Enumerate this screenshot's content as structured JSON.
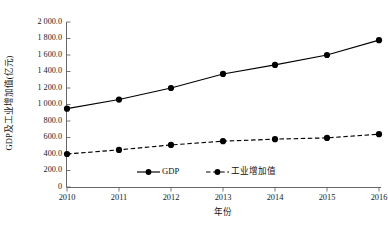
{
  "chart_data": {
    "type": "line",
    "title": "",
    "xlabel": "年份",
    "ylabel": "GDP及工业增加值(亿元)",
    "categories": [
      "2010",
      "2011",
      "2012",
      "2013",
      "2014",
      "2015",
      "2016"
    ],
    "x": [
      2010,
      2011,
      2012,
      2013,
      2014,
      2015,
      2016
    ],
    "series": [
      {
        "name": "GDP",
        "style": "solid",
        "marker": "filled-circle",
        "values": [
          950,
          1060,
          1200,
          1370,
          1480,
          1600,
          1780
        ]
      },
      {
        "name": "工业增加值",
        "style": "dashed",
        "marker": "filled-circle",
        "values": [
          400,
          450,
          510,
          555,
          580,
          595,
          640
        ]
      }
    ],
    "ylim": [
      0,
      2000
    ],
    "xlim": [
      2010,
      2016
    ],
    "ytick_step": 200,
    "ytick_values": [
      0,
      200,
      400,
      600,
      800,
      1000,
      1200,
      1400,
      1600,
      1800,
      2000
    ],
    "ytick_labels": [
      "0",
      "200.0",
      "400.0",
      "600.0",
      "800.0",
      "1 000.0",
      "1 200.0",
      "1 400.0",
      "1 600.0",
      "1 800.0",
      "2 000.0"
    ],
    "xtick_labels": [
      "2010",
      "2011",
      "2012",
      "2013",
      "2014",
      "2015",
      "2016"
    ],
    "grid": false,
    "legend_position": "inside-bottom-center",
    "legend_entries": [
      "GDP",
      "工业增加值"
    ],
    "colors": {
      "series": "#000000",
      "axis": "#555555",
      "text": "#111111",
      "background": "#ffffff"
    }
  },
  "axes": {
    "y_title": "GDP及工业增加值(亿元)",
    "x_title": "年份"
  },
  "legend": {
    "items": [
      {
        "label": "GDP",
        "line": "solid"
      },
      {
        "label": "工业增加值",
        "line": "dashed"
      }
    ]
  }
}
